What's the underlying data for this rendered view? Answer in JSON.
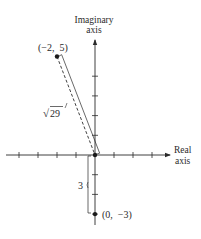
{
  "diagram": {
    "type": "complex-plane",
    "axes": {
      "imaginary_label_line1": "Imaginary",
      "imaginary_label_line2": "axis",
      "real_label_line1": "Real",
      "real_label_line2": "axis"
    },
    "points": [
      {
        "label": "(−2,  5)",
        "x": -2,
        "y": 5
      },
      {
        "label": "(0,  −3)",
        "x": 0,
        "y": -3
      }
    ],
    "origin": {
      "x": 0,
      "y": 0
    },
    "distances": {
      "to_first_point_label": "29",
      "to_first_point_radical": "√",
      "to_second_point_label": "3"
    },
    "ticks": {
      "real": [
        -4,
        -3,
        -2,
        -1,
        1,
        2,
        3
      ],
      "imaginary": [
        -3,
        -2,
        -1,
        1,
        2,
        3,
        4
      ]
    },
    "colors": {
      "ink": "#2a2a2a",
      "background": "#ffffff"
    }
  }
}
